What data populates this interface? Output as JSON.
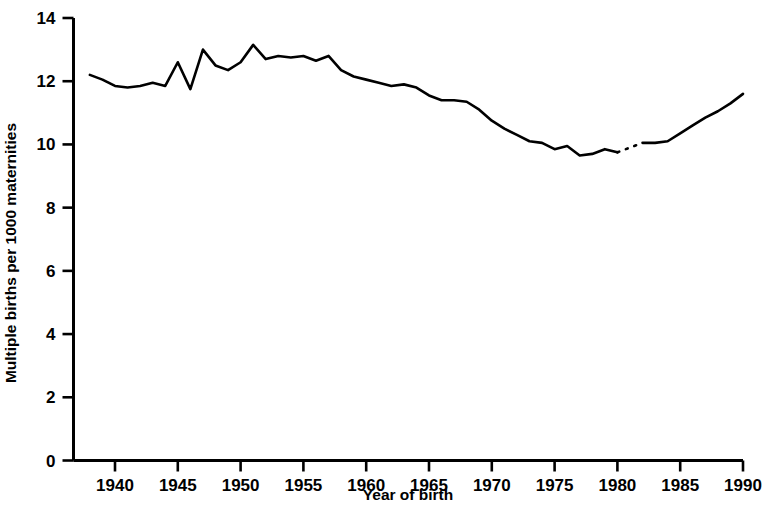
{
  "chart_data": {
    "type": "line",
    "title": "",
    "xlabel": "Year of birth",
    "ylabel": "Multiple births per 1000 maternities",
    "xlim": [
      1938,
      1990
    ],
    "ylim": [
      0,
      14
    ],
    "yticks": [
      0,
      2,
      4,
      6,
      8,
      10,
      12,
      14
    ],
    "ytick_labels": [
      "0",
      "2",
      "4",
      "6",
      "8",
      "10",
      "12",
      "14"
    ],
    "xticks": [
      1940,
      1945,
      1950,
      1955,
      1960,
      1965,
      1970,
      1975,
      1980,
      1985,
      1990
    ],
    "xtick_labels": [
      "1940",
      "1945",
      "1950",
      "1955",
      "1960",
      "1965",
      "1970",
      "1975",
      "1980",
      "1985",
      "1990"
    ],
    "grid": false,
    "legend": false,
    "legend_position": "none",
    "line_color": "#000000",
    "background_color": "#ffffff",
    "axis_style": "left-and-bottom-spines-only",
    "gap_note": "line is drawn dotted between 1980 and 1982 indicating a data discontinuity",
    "dotted_segment_years": [
      1980,
      1982
    ],
    "x": [
      1938,
      1939,
      1940,
      1941,
      1942,
      1943,
      1944,
      1945,
      1946,
      1947,
      1948,
      1949,
      1950,
      1951,
      1952,
      1953,
      1954,
      1955,
      1956,
      1957,
      1958,
      1959,
      1960,
      1961,
      1962,
      1963,
      1964,
      1965,
      1966,
      1967,
      1968,
      1969,
      1970,
      1971,
      1972,
      1973,
      1974,
      1975,
      1976,
      1977,
      1978,
      1979,
      1980,
      1981,
      1982,
      1983,
      1984,
      1985,
      1986,
      1987,
      1988,
      1989,
      1990
    ],
    "values": [
      12.2,
      12.05,
      11.85,
      11.8,
      11.85,
      11.95,
      11.85,
      12.6,
      11.75,
      13.0,
      12.5,
      12.35,
      12.6,
      13.15,
      12.7,
      12.8,
      12.75,
      12.8,
      12.65,
      12.8,
      12.35,
      12.15,
      12.05,
      11.95,
      11.85,
      11.9,
      11.8,
      11.55,
      11.4,
      11.4,
      11.35,
      11.1,
      10.75,
      10.5,
      10.3,
      10.1,
      10.05,
      9.85,
      9.95,
      9.65,
      9.7,
      9.85,
      9.75,
      9.9,
      10.05,
      10.05,
      10.1,
      10.35,
      10.6,
      10.85,
      11.05,
      11.3,
      11.6
    ],
    "series": [
      {
        "name": "Multiple births per 1000 maternities",
        "values": [
          12.2,
          12.05,
          11.85,
          11.8,
          11.85,
          11.95,
          11.85,
          12.6,
          11.75,
          13.0,
          12.5,
          12.35,
          12.6,
          13.15,
          12.7,
          12.8,
          12.75,
          12.8,
          12.65,
          12.8,
          12.35,
          12.15,
          12.05,
          11.95,
          11.85,
          11.9,
          11.8,
          11.55,
          11.4,
          11.4,
          11.35,
          11.1,
          10.75,
          10.5,
          10.3,
          10.1,
          10.05,
          9.85,
          9.95,
          9.65,
          9.7,
          9.85,
          9.75,
          9.9,
          10.05,
          10.05,
          10.1,
          10.35,
          10.6,
          10.85,
          11.05,
          11.3,
          11.6
        ]
      }
    ]
  }
}
